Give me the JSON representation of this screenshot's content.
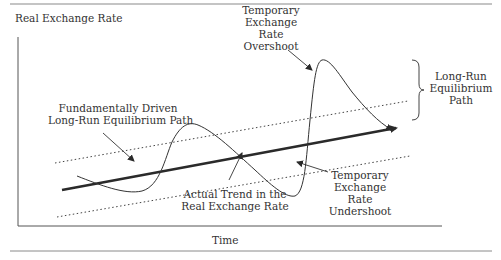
{
  "diagram": {
    "y_axis_label": "Real Exchange Rate",
    "x_axis_label": "Time",
    "labels": {
      "fundamental_path": [
        "Fundamentally Driven",
        "Long-Run Equilibrium Path"
      ],
      "overshoot": [
        "Temporary",
        "Exchange",
        "Rate",
        "Overshoot"
      ],
      "undershoot": [
        "Temporary",
        "Exchange",
        "Rate",
        "Undershoot"
      ],
      "actual_trend": [
        "Actual Trend in the",
        "Real Exchange Rate"
      ],
      "band": [
        "Long-Run",
        "Equilibrium",
        "Path"
      ]
    },
    "elements": {
      "trend_line": "thick arrow, fundamentally driven long-run equilibrium path",
      "upper_band": "dotted line",
      "lower_band": "dotted line",
      "actual_path": "thin oscillating curve with arrow"
    },
    "colors": {
      "line": "#2a2a2a",
      "text": "#333333",
      "rule": "#8a8a8a"
    }
  }
}
